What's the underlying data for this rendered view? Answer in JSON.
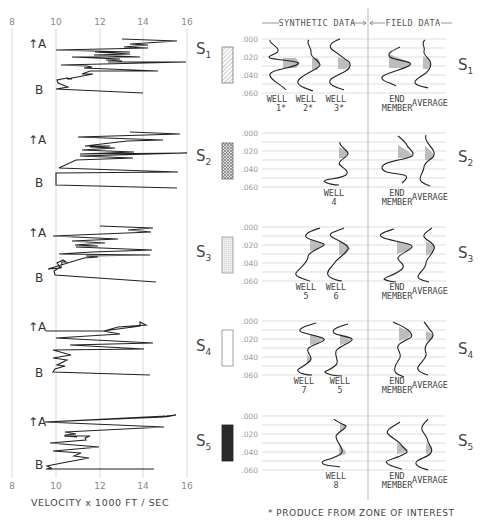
{
  "velocity_panel": {
    "x_ticks": [
      "8",
      "10",
      "12",
      "14",
      "16"
    ],
    "x_label": "VELOCITY x 1000 FT / SEC",
    "marker_top": "A",
    "marker_bottom": "B"
  },
  "header": {
    "synthetic": "SYNTHETIC DATA",
    "field": "FIELD DATA"
  },
  "time_ticks": [
    ".000",
    ".020",
    ".040",
    ".060"
  ],
  "footnote": "* PRODUCE FROM ZONE OF INTEREST",
  "colors": {
    "line": "#222222",
    "grid": "#c8c8c8",
    "fill": "#b9b9b9",
    "s5_box": "#2a2a2a"
  },
  "rows": [
    {
      "id": "S1",
      "label": "S",
      "sub": "1",
      "box_pattern": "diagonal-hatch",
      "synthetic": [
        {
          "l1": "WELL",
          "l2": "1*"
        },
        {
          "l1": "WELL",
          "l2": "2*"
        },
        {
          "l1": "WELL",
          "l2": "3*"
        }
      ],
      "field": [
        {
          "l1": "END",
          "l2": "MEMBER"
        },
        {
          "l1": "AVERAGE",
          "l2": ""
        }
      ]
    },
    {
      "id": "S2",
      "label": "S",
      "sub": "2",
      "box_pattern": "cross-hatch",
      "synthetic": [
        {
          "l1": "WELL",
          "l2": "4"
        }
      ],
      "field": [
        {
          "l1": "END",
          "l2": "MEMBER"
        },
        {
          "l1": "AVERAGE",
          "l2": ""
        }
      ]
    },
    {
      "id": "S3",
      "label": "S",
      "sub": "3",
      "box_pattern": "light-stipple",
      "synthetic": [
        {
          "l1": "WELL",
          "l2": "5"
        },
        {
          "l1": "WELL",
          "l2": "6"
        }
      ],
      "field": [
        {
          "l1": "END",
          "l2": "MEMBER"
        },
        {
          "l1": "AVERAGE",
          "l2": ""
        }
      ]
    },
    {
      "id": "S4",
      "label": "S",
      "sub": "4",
      "box_pattern": "empty",
      "synthetic": [
        {
          "l1": "WELL",
          "l2": "7"
        },
        {
          "l1": "WELL",
          "l2": "5"
        }
      ],
      "field": [
        {
          "l1": "END",
          "l2": "MEMBER"
        },
        {
          "l1": "AVERAGE",
          "l2": ""
        }
      ]
    },
    {
      "id": "S5",
      "label": "S",
      "sub": "5",
      "box_pattern": "solid-black",
      "synthetic": [
        {
          "l1": "WELL",
          "l2": "8"
        }
      ],
      "field": [
        {
          "l1": "END",
          "l2": "MEMBER"
        },
        {
          "l1": "AVERAGE",
          "l2": ""
        }
      ]
    }
  ]
}
